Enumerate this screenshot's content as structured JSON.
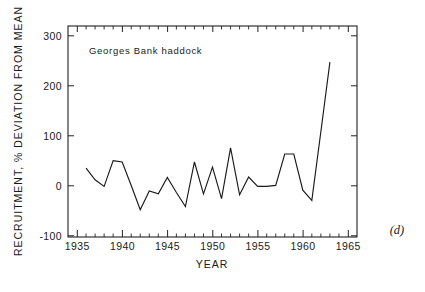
{
  "panel": {
    "label": "(d)"
  },
  "chart_data": {
    "type": "line",
    "title": "",
    "annotation": "Georges  Bank  haddock",
    "xlabel": "YEAR",
    "ylabel": "RECRUITMENT, % DEVIATION FROM MEAN",
    "xlim": [
      1934,
      1966
    ],
    "ylim": [
      -130,
      320
    ],
    "xticks": [
      1935,
      1940,
      1945,
      1950,
      1955,
      1960,
      1965
    ],
    "xtick_labels": [
      "1935",
      "1940",
      "1945",
      "1950",
      "1955",
      "1960",
      "1965"
    ],
    "yticks": [
      -100,
      0,
      100,
      200,
      300
    ],
    "ytick_labels": [
      "-100",
      "0",
      "100",
      "200",
      "300"
    ],
    "minor_x_step": 1,
    "grid": false,
    "legend": false,
    "line_color": "#1a1a1a",
    "x": [
      1936,
      1937,
      1938,
      1939,
      1940,
      1941,
      1942,
      1943,
      1944,
      1945,
      1946,
      1947,
      1948,
      1949,
      1950,
      1951,
      1952,
      1953,
      1954,
      1955,
      1956,
      1957,
      1958,
      1959,
      1960,
      1961,
      1962,
      1963
    ],
    "values": [
      17,
      -8,
      -22,
      33,
      30,
      -20,
      -72,
      -32,
      -38,
      -3,
      -35,
      -65,
      30,
      -38,
      19,
      -48,
      60,
      -40,
      -2,
      -22,
      -22,
      -20,
      47,
      47,
      -30,
      -52,
      95,
      243
    ]
  }
}
